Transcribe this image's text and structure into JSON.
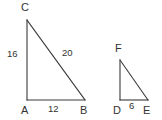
{
  "figure": {
    "background_color": "#ffffff",
    "stroke_color": "#3a3a38",
    "text_color": "#33322f",
    "width": 162,
    "height": 120
  },
  "triangles": [
    {
      "name": "triangle-ABC",
      "vertices": {
        "C": {
          "label": "C",
          "x": 27,
          "y": 20
        },
        "A": {
          "label": "A",
          "x": 27,
          "y": 100
        },
        "B": {
          "label": "B",
          "x": 85,
          "y": 100
        }
      },
      "sides": {
        "leg_vertical": {
          "label": "16",
          "from": "A",
          "to": "C"
        },
        "leg_horizontal": {
          "label": "12",
          "from": "A",
          "to": "B"
        },
        "hypotenuse": {
          "label": "20",
          "from": "C",
          "to": "B"
        }
      }
    },
    {
      "name": "triangle-DEF",
      "vertices": {
        "F": {
          "label": "F",
          "x": 120,
          "y": 60
        },
        "D": {
          "label": "D",
          "x": 120,
          "y": 100
        },
        "E": {
          "label": "E",
          "x": 148,
          "y": 100
        }
      },
      "sides": {
        "leg_vertical": {
          "label": "",
          "from": "D",
          "to": "F"
        },
        "leg_horizontal": {
          "label": "6",
          "from": "D",
          "to": "E"
        },
        "hypotenuse": {
          "label": "",
          "from": "F",
          "to": "E"
        }
      }
    }
  ]
}
